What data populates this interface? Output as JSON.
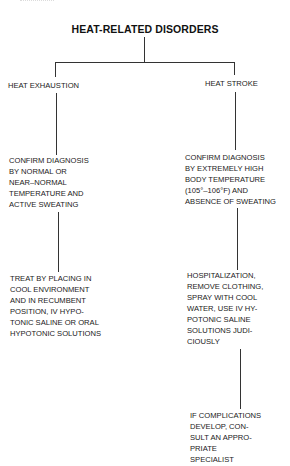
{
  "title": "HEAT-RELATED DISORDERS",
  "branches": {
    "left": {
      "label": "HEAT EXHAUSTION",
      "diagnosis": [
        "CONFIRM DIAGNOSIS",
        "BY NORMAL OR",
        "NEAR–NORMAL",
        "TEMPERATURE AND",
        "ACTIVE SWEATING"
      ],
      "treatment": [
        "TREAT BY PLACING IN",
        "COOL ENVIRONMENT",
        "AND IN RECUMBENT",
        "POSITION, IV HYPO-",
        "TONIC SALINE OR ORAL",
        "HYPOTONIC SOLUTIONS"
      ]
    },
    "right": {
      "label": "HEAT STROKE",
      "diagnosis": [
        "CONFIRM DIAGNOSIS",
        "BY EXTREMELY HIGH",
        "BODY TEMPERATURE",
        "(105°–106°F) AND",
        "ABSENCE OF SWEATING"
      ],
      "treatment": [
        "HOSPITALIZATION,",
        "REMOVE CLOTHING,",
        "SPRAY WITH COOL",
        "WATER, USE IV HY-",
        "POTONIC SALINE",
        "SOLUTIONS JUDI-",
        "CIOUSLY"
      ],
      "complications": [
        "IF COMPLICATIONS",
        "DEVELOP, CON-",
        "SULT AN APPRO-",
        "PRIATE",
        "SPECIALIST"
      ]
    }
  },
  "colors": {
    "line": "#333333",
    "text": "#1a1a1a",
    "background": "#ffffff"
  }
}
